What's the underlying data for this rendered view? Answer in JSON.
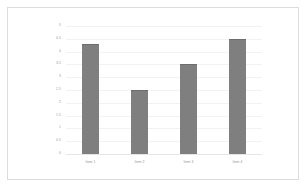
{
  "frame": {
    "border_color": "#dcdcdc",
    "background": "#ffffff"
  },
  "chart_data": {
    "type": "bar",
    "title": "",
    "subtitle": "",
    "xlabel": "",
    "ylabel": "",
    "categories": [
      "Item 1",
      "Item 2",
      "Item 3",
      "Item 4"
    ],
    "values": [
      4.3,
      2.5,
      3.5,
      4.5
    ],
    "ylim": [
      0,
      5
    ],
    "ytick_step": 0.5,
    "yticks": [
      "0",
      "0.5",
      "1",
      "1.5",
      "2",
      "2.5",
      "3",
      "3.5",
      "4",
      "4.5",
      "5"
    ],
    "ytick_values": [
      0,
      0.5,
      1,
      1.5,
      2,
      2.5,
      3,
      3.5,
      4,
      4.5,
      5
    ],
    "grid": true,
    "grid_axis": "y",
    "legend": false,
    "legend_position": "none",
    "series": [
      {
        "name": "Series 1",
        "color": "#807f7f",
        "values": [
          4.3,
          2.5,
          3.5,
          4.5
        ]
      }
    ],
    "colors": {
      "bar_fill": "#807f7f",
      "bar_edge": "#6e6d6d",
      "gridline": "#f2f2f2",
      "axis": "#e6e6e6",
      "tick_text": "#9a9a9a"
    }
  }
}
